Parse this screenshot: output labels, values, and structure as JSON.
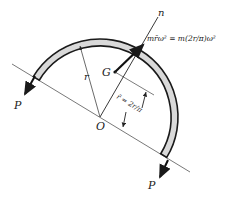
{
  "diagram": {
    "labels": {
      "n_axis": "n",
      "centripetal_force": "mr̄ω² = m(2r/π)ω²",
      "centroid": "G",
      "radius": "r",
      "pivot": "O",
      "rbar_dimension": "r̄ = 2r/π",
      "force_left": "P",
      "force_right": "P"
    },
    "colors": {
      "rod_fill": "#d9d9d9",
      "rod_edge": "#1a1a1a",
      "line": "#444444"
    }
  }
}
